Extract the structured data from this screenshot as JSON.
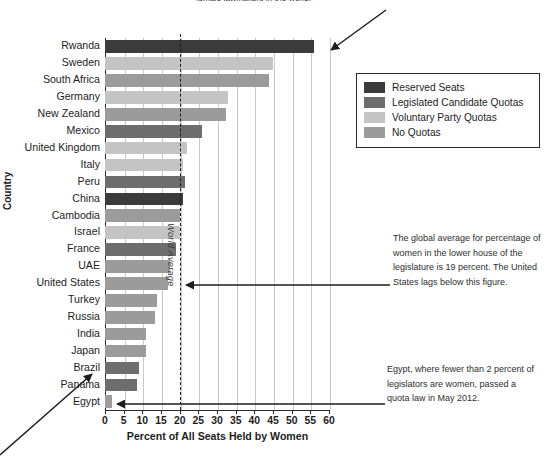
{
  "top_caption": "female lawmakers in the world.",
  "axes": {
    "y_title": "Country",
    "x_title": "Percent of All Seats Held by Women",
    "world_average_label": "World Average"
  },
  "legend": {
    "items": [
      {
        "label": "Reserved Seats",
        "color": "#3b3b3b"
      },
      {
        "label": "Legislated Candidate Quotas",
        "color": "#6d6d6d"
      },
      {
        "label": "Voluntary Party Quotas",
        "color": "#c4c4c4"
      },
      {
        "label": "No Quotas",
        "color": "#9b9b9b"
      }
    ]
  },
  "annotations": {
    "world_average": "The global average for percentage of women in the lower house of the legislature is 19 percent. The United States lags below this figure.",
    "egypt": "Egypt, where fewer than 2 percent of legislators are women, passed a quota law in May 2012."
  },
  "chart_data": {
    "type": "bar",
    "orientation": "horizontal",
    "title": "",
    "xlabel": "Percent of All Seats Held by Women",
    "ylabel": "Country",
    "xlim": [
      0,
      60
    ],
    "xticks": [
      0,
      5,
      10,
      15,
      20,
      25,
      30,
      35,
      40,
      45,
      50,
      55,
      60
    ],
    "grid": true,
    "legend_position": "upper-right-outside",
    "reference_line": {
      "label": "World Average",
      "value": 20
    },
    "categories": [
      "Rwanda",
      "Sweden",
      "South Africa",
      "Germany",
      "New Zealand",
      "Mexico",
      "United Kingdom",
      "Italy",
      "Peru",
      "China",
      "Cambodia",
      "Israel",
      "France",
      "UAE",
      "United States",
      "Turkey",
      "Russia",
      "India",
      "Japan",
      "Brazil",
      "Panama",
      "Egypt"
    ],
    "values": [
      56,
      45,
      44,
      33,
      32.5,
      26,
      22,
      21,
      21.5,
      21,
      20,
      20,
      19,
      17.5,
      17,
      14,
      13.5,
      11,
      11,
      9,
      8.5,
      2
    ],
    "quota_type": [
      "Reserved Seats",
      "Voluntary Party Quotas",
      "No Quotas",
      "Voluntary Party Quotas",
      "No Quotas",
      "Legislated Candidate Quotas",
      "Voluntary Party Quotas",
      "Voluntary Party Quotas",
      "Legislated Candidate Quotas",
      "Reserved Seats",
      "No Quotas",
      "Voluntary Party Quotas",
      "Legislated Candidate Quotas",
      "No Quotas",
      "No Quotas",
      "No Quotas",
      "No Quotas",
      "No Quotas",
      "No Quotas",
      "Legislated Candidate Quotas",
      "Legislated Candidate Quotas",
      "No Quotas"
    ],
    "colors": {
      "Reserved Seats": "#3b3b3b",
      "Legislated Candidate Quotas": "#6d6d6d",
      "Voluntary Party Quotas": "#c4c4c4",
      "No Quotas": "#9b9b9b"
    }
  }
}
